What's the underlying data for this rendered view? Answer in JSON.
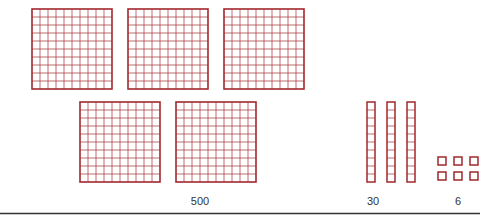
{
  "diagram": {
    "color": "#a0282d",
    "groups": [
      {
        "name": "hundreds",
        "count": 5,
        "label": "500",
        "unit_value": 100
      },
      {
        "name": "tens",
        "count": 3,
        "label": "30",
        "unit_value": 10
      },
      {
        "name": "ones",
        "count": 6,
        "label": "6",
        "unit_value": 1
      }
    ]
  }
}
